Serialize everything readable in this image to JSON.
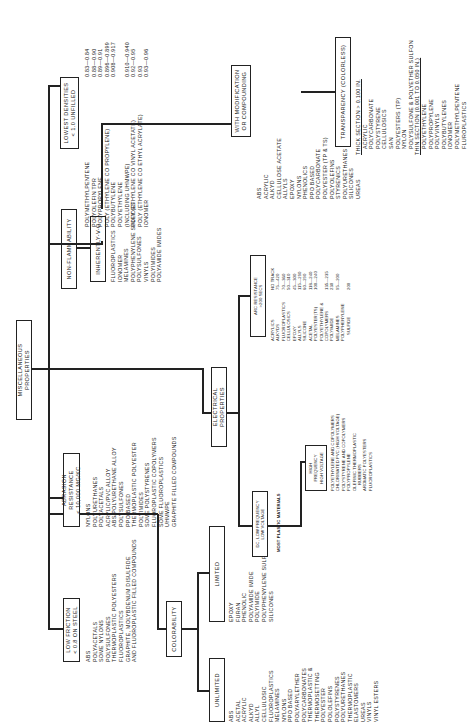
{
  "title": "MISCELLANEOUS PROPERTIES",
  "branches": {
    "low_friction": {
      "label": [
        "LOW FRICTION",
        "< 0.8 ON STEEL"
      ],
      "items": [
        "ABS",
        "POLYACETALS",
        "SOME NYLONS",
        "POLYSULFONES",
        "THERMOPLASTIC POLYESTERS",
        "FLUOROPLASTICS",
        "GRAPHITE, MOLYBDENUM DISULFIDE",
        "AND FLUOROPLASTIC FILLED COMPOUNDS"
      ]
    },
    "abrasion": {
      "label": [
        "ABRASION RESISTANCE",
        "< 10,000 MG/KC"
      ],
      "items": [
        "NYLONS",
        "POLYURETHANES",
        "POLYACETALS",
        "ACRYLIC/PVC ALLOY",
        "ABS/POLYURETHANE ALLOY",
        "POLYSULFONES",
        "PPO BASED",
        "THERMOPLASTIC POLYESTER",
        "POLYIMIDES",
        "SOME POLYSTYRENES",
        "FLUOROPLASTIC COPOLYMERS",
        "SOME FLUOROPLASTICS",
        "UHMWPE",
        "GRAPHITE FILLED COMPOUNDS"
      ]
    },
    "non_flammability": {
      "label": "NON-FLAMMABILITY",
      "sub_label": "INHERENTLY-V-O",
      "items": [
        "FLUOROPLASTICS",
        "IONOMER",
        "MELAMINES",
        "POLYPHENYLENE SULFIDES",
        "POLYSULFONES",
        "VINYLS",
        "POLYIMIDES",
        "POLYAMIDE IMIDES"
      ]
    },
    "lowest_densities": {
      "label": [
        "LOWEST DENSITIES",
        "< 1.0 UNFILLED"
      ],
      "items": [
        {
          "name": "POLYMETHYLPENTENE",
          "value": "0.83—0.84"
        },
        {
          "name": "POLYOLEFIN TPR",
          "value": "0.88—0.90"
        },
        {
          "name": "POLYPROPYLENE",
          "value": "0.89—0.91"
        },
        {
          "name": "POLY (ETHYLENE CO PROPYLENE)",
          "value": "0.896—0.899"
        },
        {
          "name": "POLYBUTYLENE",
          "value": "0.908—0.917"
        },
        {
          "name": "POLYETHYLENE",
          "value": ""
        },
        {
          "name": "(INCLUDING UHMWPE)",
          "value": "0.910—0.940"
        },
        {
          "name": "POLY (ETHYLENE CO VINYL ACETATE)",
          "value": "0.92—0.95"
        },
        {
          "name": "POLY (ETHYLENE CO ETHYL ACRYLATE)",
          "value": "0.93"
        },
        {
          "name": "IONOMER",
          "value": "0.93—0.96"
        }
      ]
    },
    "colorability": {
      "label": "COLORABILITY",
      "unlimited": {
        "label": "UNLIMITED",
        "items": [
          "ABS",
          "ACETAL",
          "ACRYLIC",
          "ALKYD",
          "ALLYL",
          "CELLULOSIC",
          "FLUOROPLASTICS",
          "MELAMINES",
          "NYLONS",
          "PPO BASED",
          "POLYARYLETHER",
          "POLYCARBONATES",
          "THERMOPLASTIC &",
          "THERMOSETTING",
          "POLYESTER",
          "POLOLEFINS",
          "POLYSTYRENES",
          "POLYURETHANES",
          "THERMOPLASTIC",
          "ELASTOMERS",
          "UREAS",
          "VINYLS",
          "VINYL ESTERS"
        ]
      },
      "limited": {
        "label": "LIMITED",
        "items": [
          "EPOXY",
          "FURAN",
          "PHENOLIC",
          "POLYAMIDE IMIDE",
          "POLYIMIDE",
          "POLYPHENYLENE SULFIDE",
          "SILICONES"
        ]
      }
    },
    "electrical": {
      "label": "ELECTRICAL PROPERTIES",
      "dc_low": {
        "label": [
          "DC, LOW FREQUENCY",
          "LOW VOLTAGE"
        ],
        "items": [
          "MOST PLASTIC MATERIALS"
        ]
      },
      "high": {
        "label": [
          "HIGH",
          "FREQUENCY",
          "HIGH VOLTAGE"
        ],
        "items": [
          "POLYETHYLENE AND COPOLYMERS",
          "CHLORINATED PVC (HIGH VOLTAGE)",
          "POLYSTYRENE AND COPOLYMERS",
          "POLYPROPYLENE",
          "OLEFINIC THERMOPLASTIC",
          "RUBBERS",
          "AROMATIC POLYESTERS",
          "FLUOROPLASTICS"
        ]
      },
      "arc": {
        "label": [
          "ARC RESISTANCE",
          ">200 SECS"
        ],
        "items": [
          {
            "name": "ACRYLICS",
            "value": "NO TRACK"
          },
          {
            "name": "ALKYDS",
            "value": "75—420"
          },
          {
            "name": "FLUOROPLASTICS",
            "value": "70—360"
          },
          {
            "name": "CELLULOSICS",
            "value": "50—310"
          },
          {
            "name": "EPOXY",
            "value": "45—300"
          },
          {
            "name": "ALLYLS",
            "value": "115—290"
          },
          {
            "name": "SILICONE",
            "value": "60—290"
          },
          {
            "name": "ACETAL",
            "value": "118—240"
          },
          {
            "name": "POLYESTER(TS)",
            "value": "100—240"
          },
          {
            "name": "POLYETHYLENE &",
            "value": ""
          },
          {
            "name": "COPOLYMERS",
            "value": "135—235"
          },
          {
            "name": "POLYIMIDE",
            "value": "230"
          },
          {
            "name": "MELAMINES",
            "value": "95—200"
          },
          {
            "name": "POLYPHENYLENE",
            "value": ""
          },
          {
            "name": "SULFIDE",
            "value": "200"
          }
        ]
      }
    },
    "with_modification": {
      "label": [
        "WITH MODIFICATION",
        "OR COMPOUNDING"
      ],
      "items": [
        "ABS",
        "ACRYLIC",
        "ALKYD",
        "CELLULOSE ACETATE",
        "ALLYLS",
        "EPOXY",
        "NYLONS",
        "PHENOLICS",
        "PPO BASED",
        "POLYCARBONATE",
        "POLYESTER (TP & TS)",
        "POLYOLEFINS",
        "STYRENICS",
        "POLYURETHANES",
        "SILICONES",
        "UREAS"
      ]
    },
    "transparency": {
      "label": "TRANSPARENCY (COLORLESS)",
      "thick_heading": "THICK SECTION > 0.100 IN.",
      "thick_items": [
        "ACRYLIC",
        "POLYCARBONATE",
        "POLYSTYRENE",
        "CELLULOSICS",
        "SAN",
        "POLYESTERS (TP)",
        "NYLON",
        "POLYSULFONE & POLYETHER SULFON"
      ],
      "thin_heading": "THIN SECTION (0.001 TO 0.050 IN.)",
      "thin_items": [
        "POLYETHYLENE",
        "POLYPROPYLENE",
        "POLYVINYLS",
        "POLYBUTYLENES",
        "IONOMER",
        "POLYMETHYLPENTENE",
        "FLUROPLASTICS"
      ]
    }
  }
}
